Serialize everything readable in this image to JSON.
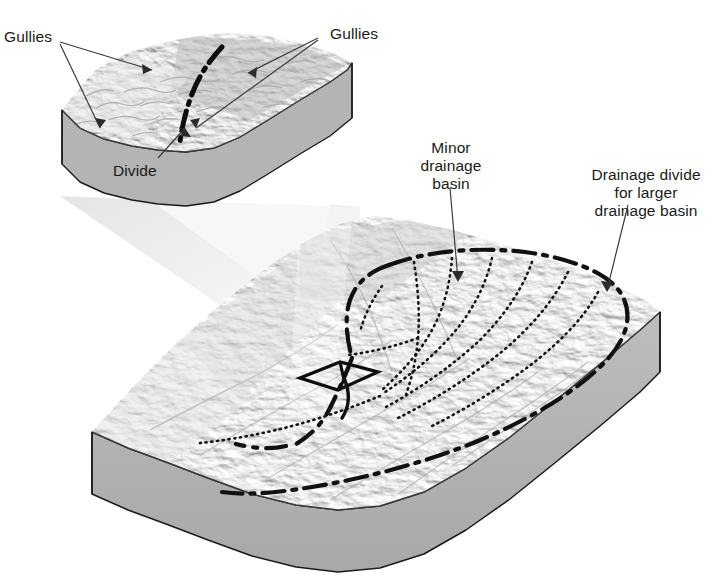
{
  "figure": {
    "background_color": "#ffffff",
    "width": 726,
    "height": 581
  },
  "labels": {
    "gullies_left": "Gullies",
    "gullies_right": "Gullies",
    "divide": "Divide",
    "minor_drainage_basin_line1": "Minor",
    "minor_drainage_basin_line2": "drainage",
    "minor_drainage_basin_line3": "basin",
    "drainage_divide_line1": "Drainage divide",
    "drainage_divide_line2": "for larger",
    "drainage_divide_line3": "drainage basin"
  },
  "colors": {
    "ink": "#1a1a1a",
    "block_side_fill": "#b3b3b3",
    "block_side_fill_dark": "#a2a2a2",
    "terrain_light": "#f2f2f2",
    "terrain_mid": "#d8d8d8",
    "terrain_dark": "#b8b8b8",
    "inset_terrain_mid": "#c9c9c9",
    "cone_fill": "#ececec",
    "leader_line": "#4a4a4a"
  },
  "elements": {
    "inset_block_name": "magnified-terrain-block",
    "main_block_name": "regional-terrain-block",
    "magnification_cone_name": "magnification-cone",
    "study_area_outline_name": "study-area-outline",
    "divide_line_style": "dash-dot",
    "minor_basin_line_style": "dotted"
  }
}
